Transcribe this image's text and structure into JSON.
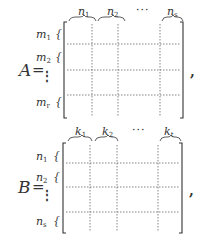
{
  "matrices": [
    {
      "name": "A",
      "equals": "=",
      "trailing": ",",
      "column_labels": [
        {
          "base": "n",
          "sub": "1"
        },
        {
          "base": "n",
          "sub": "2"
        },
        {
          "ellipsis": "···"
        },
        {
          "base": "n",
          "sub": "s"
        }
      ],
      "row_labels": [
        {
          "base": "m",
          "sub": "1"
        },
        {
          "base": "m",
          "sub": "2"
        },
        {
          "ellipsis": "⋮"
        },
        {
          "base": "m",
          "sub": "r"
        }
      ],
      "row_brace": "{"
    },
    {
      "name": "B",
      "equals": "=",
      "trailing": ",",
      "column_labels": [
        {
          "base": "k",
          "sub": "1"
        },
        {
          "base": "k",
          "sub": "2"
        },
        {
          "ellipsis": "···"
        },
        {
          "base": "k",
          "sub": "t"
        }
      ],
      "row_labels": [
        {
          "base": "n",
          "sub": "1"
        },
        {
          "base": "n",
          "sub": "2"
        },
        {
          "ellipsis": "⋮"
        },
        {
          "base": "n",
          "sub": "s"
        }
      ],
      "row_brace": "{"
    }
  ],
  "colors": {
    "ink": "#333333",
    "dotted": "#666666"
  }
}
